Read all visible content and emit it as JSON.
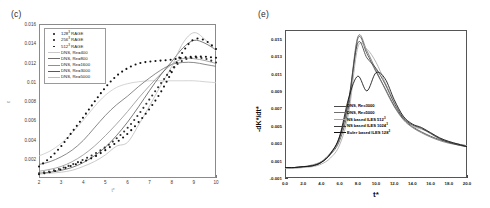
{
  "figure": {
    "panels": [
      {
        "label": "(c)",
        "xlabel": "t*",
        "ylabel": "ε",
        "xticks": [
          "2",
          "3",
          "4",
          "5",
          "6",
          "7",
          "8",
          "9",
          "10"
        ],
        "yticks": [
          "0.002",
          "0.004",
          "0.006",
          "0.008",
          "0.01",
          "0.012",
          "0.014",
          "0.016"
        ],
        "legend": [
          {
            "marker": "dot",
            "text_main": "128",
            "text_sup": "3",
            "text_tail": " RAGE",
            "color": "#111111"
          },
          {
            "marker": "dot",
            "text_main": "256",
            "text_sup": "3",
            "text_tail": " RAGE",
            "color": "#111111"
          },
          {
            "marker": "dot",
            "text_main": "512",
            "text_sup": "3",
            "text_tail": " RAGE",
            "color": "#111111"
          },
          {
            "marker": "line",
            "text_main": "DNS, Re=400",
            "text_sup": "",
            "text_tail": "",
            "color": "#c9c9c9"
          },
          {
            "marker": "line",
            "text_main": "DNS, Re=800",
            "text_sup": "",
            "text_tail": "",
            "color": "#6d6d6d"
          },
          {
            "marker": "line",
            "text_main": "DNS, Re=1600",
            "text_sup": "",
            "text_tail": "",
            "color": "#8f8f8f"
          },
          {
            "marker": "line",
            "text_main": "DNS, Re=3000",
            "text_sup": "",
            "text_tail": "",
            "color": "#5a5a5a"
          },
          {
            "marker": "line",
            "text_main": "DNS, Re=5000",
            "text_sup": "",
            "text_tail": "",
            "color": "#bdbdbd"
          }
        ]
      },
      {
        "label": "(e)",
        "xlabel": "t*",
        "ylabel": "-dK*/dt*",
        "xticks": [
          "0.0",
          "2.0",
          "4.0",
          "6.0",
          "8.0",
          "10.0",
          "12.0",
          "14.0",
          "16.0",
          "18.0",
          "20.0"
        ],
        "yticks": [
          "-0.001",
          "0.001",
          "0.003",
          "0.005",
          "0.007",
          "0.009",
          "0.011",
          "0.013",
          "0.015"
        ],
        "legend": [
          {
            "marker": "line-dot",
            "text_main": "DNS, Re=3000",
            "text_sup": "",
            "text_tail": "",
            "color": "#4a4a4a"
          },
          {
            "marker": "line-dot",
            "text_main": "DNS, Re=5000",
            "text_sup": "",
            "text_tail": "",
            "color": "#6f6f6f"
          },
          {
            "marker": "line",
            "text_main": "NS based ILES 512",
            "text_sup": "3",
            "text_tail": "",
            "color": "#a8a8a8"
          },
          {
            "marker": "line",
            "text_main": "NS based ILES 1024",
            "text_sup": "3",
            "text_tail": "",
            "color": "#3c3c3c"
          },
          {
            "marker": "line",
            "text_main": "Euler based ILES 128",
            "text_sup": "3",
            "text_tail": "",
            "color": "#111111"
          }
        ]
      }
    ]
  },
  "chart_data": [
    {
      "type": "scatter",
      "panel": "(c)",
      "title": "",
      "xlabel": "t*",
      "ylabel": "ε",
      "xlim": [
        2,
        10
      ],
      "ylim": [
        0,
        0.016
      ],
      "grid": false,
      "legend_position": "top-left",
      "x": [
        2.0,
        2.5,
        3.0,
        3.5,
        4.0,
        4.5,
        5.0,
        5.5,
        6.0,
        6.5,
        7.0,
        7.5,
        8.0,
        8.5,
        9.0,
        9.5,
        10.0
      ],
      "series": [
        {
          "name": "128³ RAGE",
          "style": "markers",
          "values": [
            0.0004,
            0.0006,
            0.0009,
            0.0013,
            0.0017,
            0.0022,
            0.0029,
            0.0037,
            0.0046,
            0.0058,
            0.0072,
            0.0089,
            0.011,
            0.0131,
            0.0144,
            0.0143,
            0.0134
          ]
        },
        {
          "name": "256³ RAGE",
          "style": "markers",
          "values": [
            0.0005,
            0.0007,
            0.001,
            0.0014,
            0.0019,
            0.0025,
            0.0032,
            0.0041,
            0.0052,
            0.0066,
            0.0082,
            0.0098,
            0.0113,
            0.0122,
            0.0125,
            0.0124,
            0.012
          ]
        },
        {
          "name": "512³ RAGE",
          "style": "markers",
          "values": [
            0.0012,
            0.0021,
            0.0033,
            0.0048,
            0.0063,
            0.0079,
            0.0094,
            0.0106,
            0.0114,
            0.0119,
            0.0121,
            0.0122,
            0.0123,
            0.0125,
            0.0126,
            0.0126,
            0.0125
          ]
        },
        {
          "name": "DNS, Re=400",
          "style": "line",
          "values": [
            0.0023,
            0.0028,
            0.0036,
            0.0047,
            0.006,
            0.0074,
            0.0086,
            0.0094,
            0.0098,
            0.01,
            0.0101,
            0.0101,
            0.0101,
            0.0101,
            0.0101,
            0.01,
            0.0099
          ]
        },
        {
          "name": "DNS, Re=800",
          "style": "line",
          "values": [
            0.0014,
            0.0017,
            0.0022,
            0.0029,
            0.0039,
            0.0052,
            0.0065,
            0.0076,
            0.0085,
            0.0095,
            0.0104,
            0.0112,
            0.0118,
            0.012,
            0.012,
            0.0118,
            0.0116
          ]
        },
        {
          "name": "DNS, Re=1600",
          "style": "line",
          "values": [
            0.0007,
            0.0009,
            0.0012,
            0.0017,
            0.0024,
            0.0033,
            0.0044,
            0.0056,
            0.0069,
            0.0083,
            0.0096,
            0.0108,
            0.0118,
            0.0124,
            0.0124,
            0.0122,
            0.0119
          ]
        },
        {
          "name": "DNS, Re=3000",
          "style": "line",
          "values": [
            0.0005,
            0.0006,
            0.0008,
            0.0011,
            0.0016,
            0.0023,
            0.0032,
            0.0044,
            0.0058,
            0.0074,
            0.0091,
            0.0107,
            0.0121,
            0.0135,
            0.0143,
            0.014,
            0.0133
          ]
        },
        {
          "name": "DNS, Re=5000",
          "style": "line",
          "values": [
            0.0004,
            0.0005,
            0.0006,
            0.0008,
            0.0012,
            0.0017,
            0.0024,
            0.0033,
            0.0037,
            0.0055,
            0.0075,
            0.0096,
            0.0116,
            0.014,
            0.0151,
            0.0144,
            0.0132
          ]
        }
      ]
    },
    {
      "type": "line",
      "panel": "(e)",
      "title": "",
      "xlabel": "t*",
      "ylabel": "-dK*/dt*",
      "xlim": [
        0,
        20
      ],
      "ylim": [
        -0.001,
        0.016
      ],
      "grid": false,
      "legend_position": "center-right",
      "x": [
        0,
        1,
        2,
        3,
        4,
        5,
        6,
        7,
        8,
        9,
        10,
        11,
        12,
        13,
        14,
        15,
        16,
        17,
        18,
        19,
        20
      ],
      "series": [
        {
          "name": "DNS, Re=3000",
          "values": [
            0.0002,
            0.0002,
            0.0003,
            0.0004,
            0.0008,
            0.0017,
            0.0033,
            0.0072,
            0.015,
            0.0133,
            0.0112,
            0.0093,
            0.0073,
            0.0058,
            0.0049,
            0.0043,
            0.0038,
            0.0034,
            0.0031,
            0.0029,
            0.0027
          ]
        },
        {
          "name": "DNS, Re=5000",
          "values": [
            0.0002,
            0.0002,
            0.0003,
            0.0005,
            0.0009,
            0.0019,
            0.0036,
            0.0078,
            0.0152,
            0.0136,
            0.0114,
            0.0092,
            0.0072,
            0.0057,
            0.0048,
            0.0042,
            0.0037,
            0.0033,
            0.003,
            0.0028,
            0.0026
          ]
        },
        {
          "name": "NS based ILES 512³",
          "values": [
            0.0001,
            0.0001,
            0.0002,
            0.0003,
            0.0006,
            0.0013,
            0.0028,
            0.0065,
            0.014,
            0.0138,
            0.0123,
            0.01,
            0.0078,
            0.006,
            0.005,
            0.0046,
            0.0042,
            0.0036,
            0.0032,
            0.0029,
            0.0027
          ]
        },
        {
          "name": "NS based ILES 1024³",
          "values": [
            0.0002,
            0.0002,
            0.0003,
            0.0004,
            0.0008,
            0.0018,
            0.0037,
            0.008,
            0.0145,
            0.0128,
            0.0116,
            0.0098,
            0.0076,
            0.0059,
            0.0051,
            0.0047,
            0.0041,
            0.0035,
            0.0031,
            0.0028,
            0.0026
          ]
        },
        {
          "name": "Euler based ILES 128³",
          "values": [
            0.0002,
            0.0002,
            0.0003,
            0.0004,
            0.0008,
            0.0018,
            0.0038,
            0.0082,
            0.0107,
            0.009,
            0.0111,
            0.0104,
            0.008,
            0.0061,
            0.0052,
            0.0048,
            0.0042,
            0.0036,
            0.0032,
            0.0029,
            0.0026
          ]
        }
      ]
    }
  ]
}
